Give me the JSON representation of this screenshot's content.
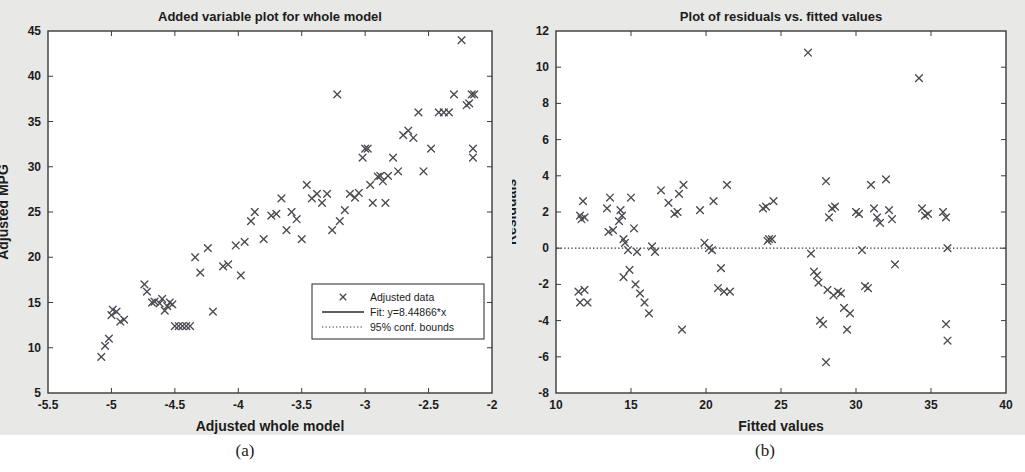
{
  "figure": {
    "background": "#e8e8e6",
    "plot_background": "#ffffff",
    "axis_color": "#3a3a3a",
    "marker_color": "#4a4a52",
    "captions": {
      "a": "(a)",
      "b": "(b)"
    }
  },
  "chart_data": [
    {
      "type": "scatter",
      "panel": "a",
      "title": "Added variable plot for whole model",
      "xlabel": "Adjusted whole model",
      "ylabel": "Adjusted MPG",
      "xlim": [
        -5.5,
        -2
      ],
      "ylim": [
        5,
        45
      ],
      "xticks": [
        -5.5,
        -5,
        -4.5,
        -4,
        -3.5,
        -3,
        -2.5,
        -2
      ],
      "xticklabels": [
        "-5.5",
        "-5",
        "-4.5",
        "-4",
        "-3.5",
        "-3",
        "-2.5",
        "-2"
      ],
      "yticks": [
        5,
        10,
        15,
        20,
        25,
        30,
        35,
        40,
        45
      ],
      "yticklabels": [
        "5",
        "10",
        "15",
        "20",
        "25",
        "30",
        "35",
        "40",
        "45"
      ],
      "grid": false,
      "marker": "x",
      "legend_position": "lower right",
      "legend": [
        {
          "label": "Adjusted data",
          "style": "marker"
        },
        {
          "label": "Fit: y=8.44866*x",
          "style": "solid-line"
        },
        {
          "label": "95% conf. bounds",
          "style": "dotted-line"
        }
      ],
      "fit": {
        "slope": 8.44866,
        "intercept": 0,
        "equation": "y=8.44866*x"
      },
      "conf_band_halfwidth": 1.0,
      "points": [
        [
          -5.08,
          9.0
        ],
        [
          -5.05,
          10.2
        ],
        [
          -5.02,
          11.0
        ],
        [
          -5.0,
          13.6
        ],
        [
          -4.99,
          14.2
        ],
        [
          -4.96,
          14.0
        ],
        [
          -4.93,
          12.9
        ],
        [
          -4.9,
          13.1
        ],
        [
          -4.74,
          17.0
        ],
        [
          -4.72,
          16.2
        ],
        [
          -4.68,
          15.0
        ],
        [
          -4.66,
          15.1
        ],
        [
          -4.62,
          14.9
        ],
        [
          -4.6,
          15.4
        ],
        [
          -4.58,
          14.1
        ],
        [
          -4.56,
          14.6
        ],
        [
          -4.54,
          15.0
        ],
        [
          -4.52,
          14.8
        ],
        [
          -4.5,
          12.4
        ],
        [
          -4.47,
          12.4
        ],
        [
          -4.44,
          12.4
        ],
        [
          -4.41,
          12.4
        ],
        [
          -4.38,
          12.4
        ],
        [
          -4.34,
          20.0
        ],
        [
          -4.3,
          18.3
        ],
        [
          -4.24,
          21.0
        ],
        [
          -4.2,
          14.0
        ],
        [
          -4.12,
          19.0
        ],
        [
          -4.08,
          19.2
        ],
        [
          -4.02,
          21.3
        ],
        [
          -3.98,
          18.0
        ],
        [
          -3.95,
          21.7
        ],
        [
          -3.9,
          24.0
        ],
        [
          -3.87,
          25.0
        ],
        [
          -3.8,
          22.0
        ],
        [
          -3.74,
          24.6
        ],
        [
          -3.7,
          24.8
        ],
        [
          -3.66,
          26.5
        ],
        [
          -3.62,
          23.0
        ],
        [
          -3.58,
          25.0
        ],
        [
          -3.54,
          24.2
        ],
        [
          -3.5,
          22.0
        ],
        [
          -3.46,
          28.0
        ],
        [
          -3.42,
          26.5
        ],
        [
          -3.38,
          27.0
        ],
        [
          -3.34,
          26.0
        ],
        [
          -3.3,
          27.0
        ],
        [
          -3.26,
          23.0
        ],
        [
          -3.22,
          38.0
        ],
        [
          -3.2,
          24.0
        ],
        [
          -3.16,
          25.2
        ],
        [
          -3.12,
          27.0
        ],
        [
          -3.08,
          26.6
        ],
        [
          -3.05,
          27.1
        ],
        [
          -3.02,
          31.0
        ],
        [
          -3.0,
          32.0
        ],
        [
          -2.98,
          32.0
        ],
        [
          -2.96,
          28.0
        ],
        [
          -2.94,
          26.0
        ],
        [
          -2.9,
          28.9
        ],
        [
          -2.88,
          29.0
        ],
        [
          -2.86,
          28.4
        ],
        [
          -2.84,
          26.0
        ],
        [
          -2.82,
          29.0
        ],
        [
          -2.78,
          31.0
        ],
        [
          -2.74,
          29.5
        ],
        [
          -2.7,
          33.5
        ],
        [
          -2.66,
          34.0
        ],
        [
          -2.62,
          33.2
        ],
        [
          -2.58,
          36.0
        ],
        [
          -2.54,
          29.5
        ],
        [
          -2.48,
          32.0
        ],
        [
          -2.42,
          36.0
        ],
        [
          -2.38,
          36.0
        ],
        [
          -2.34,
          36.0
        ],
        [
          -2.3,
          38.0
        ],
        [
          -2.24,
          44.0
        ],
        [
          -2.2,
          36.8
        ],
        [
          -2.18,
          37.0
        ],
        [
          -2.16,
          38.0
        ],
        [
          -2.14,
          38.0
        ],
        [
          -2.15,
          32.0
        ],
        [
          -2.15,
          31.0
        ]
      ]
    },
    {
      "type": "scatter",
      "panel": "b",
      "title": "Plot of residuals vs. fitted values",
      "xlabel": "Fitted values",
      "ylabel": "Residuals",
      "xlim": [
        10,
        40
      ],
      "ylim": [
        -8,
        12
      ],
      "xticks": [
        10,
        15,
        20,
        25,
        30,
        35,
        40
      ],
      "xticklabels": [
        "10",
        "15",
        "20",
        "25",
        "30",
        "35",
        "40"
      ],
      "yticks": [
        -8,
        -6,
        -4,
        -2,
        0,
        2,
        4,
        6,
        8,
        10,
        12
      ],
      "yticklabels": [
        "-8",
        "-6",
        "-4",
        "-2",
        "0",
        "2",
        "4",
        "6",
        "8",
        "10",
        "12"
      ],
      "grid": false,
      "marker": "x",
      "zero_line": 0,
      "zero_line_style": "dotted",
      "points": [
        [
          11.8,
          2.6
        ],
        [
          11.6,
          1.8
        ],
        [
          11.7,
          1.6
        ],
        [
          11.9,
          1.7
        ],
        [
          11.5,
          -2.4
        ],
        [
          11.9,
          -2.3
        ],
        [
          11.6,
          -3.0
        ],
        [
          12.1,
          -3.0
        ],
        [
          13.6,
          2.8
        ],
        [
          13.4,
          2.2
        ],
        [
          13.5,
          0.9
        ],
        [
          13.8,
          1.0
        ],
        [
          14.3,
          2.1
        ],
        [
          14.4,
          1.8
        ],
        [
          14.2,
          1.5
        ],
        [
          14.5,
          0.5
        ],
        [
          14.6,
          0.3
        ],
        [
          14.8,
          -0.1
        ],
        [
          14.9,
          -1.2
        ],
        [
          14.5,
          -1.6
        ],
        [
          15.0,
          2.8
        ],
        [
          15.2,
          1.1
        ],
        [
          15.4,
          -0.2
        ],
        [
          15.3,
          -2.0
        ],
        [
          15.6,
          -2.5
        ],
        [
          15.9,
          -3.0
        ],
        [
          16.2,
          -3.6
        ],
        [
          16.4,
          0.1
        ],
        [
          16.6,
          -0.2
        ],
        [
          17.0,
          3.2
        ],
        [
          17.5,
          2.5
        ],
        [
          17.9,
          1.9
        ],
        [
          18.1,
          2.0
        ],
        [
          18.2,
          3.0
        ],
        [
          18.5,
          3.5
        ],
        [
          18.4,
          -4.5
        ],
        [
          19.6,
          2.1
        ],
        [
          19.9,
          0.3
        ],
        [
          20.2,
          0.0
        ],
        [
          20.4,
          -0.1
        ],
        [
          20.5,
          2.6
        ],
        [
          20.8,
          -2.2
        ],
        [
          21.0,
          -1.1
        ],
        [
          21.2,
          -2.4
        ],
        [
          21.6,
          -2.4
        ],
        [
          21.4,
          3.5
        ],
        [
          23.8,
          2.2
        ],
        [
          24.0,
          2.3
        ],
        [
          24.2,
          0.5
        ],
        [
          24.1,
          0.4
        ],
        [
          24.4,
          0.5
        ],
        [
          24.5,
          2.6
        ],
        [
          26.8,
          10.8
        ],
        [
          27.0,
          -0.3
        ],
        [
          27.2,
          -1.3
        ],
        [
          27.4,
          -1.5
        ],
        [
          27.5,
          -1.9
        ],
        [
          27.6,
          -4.0
        ],
        [
          27.8,
          -4.2
        ],
        [
          28.0,
          3.7
        ],
        [
          28.2,
          1.7
        ],
        [
          28.4,
          2.2
        ],
        [
          28.6,
          2.3
        ],
        [
          28.1,
          -2.3
        ],
        [
          28.5,
          -2.6
        ],
        [
          28.8,
          -2.4
        ],
        [
          29.0,
          -2.5
        ],
        [
          29.2,
          -3.3
        ],
        [
          29.4,
          -4.5
        ],
        [
          29.6,
          -3.6
        ],
        [
          28.0,
          -6.3
        ],
        [
          30.0,
          2.0
        ],
        [
          30.2,
          1.9
        ],
        [
          30.4,
          -0.1
        ],
        [
          30.6,
          -2.1
        ],
        [
          30.8,
          -2.2
        ],
        [
          31.0,
          3.5
        ],
        [
          31.2,
          2.2
        ],
        [
          31.4,
          1.7
        ],
        [
          31.6,
          1.4
        ],
        [
          32.0,
          3.8
        ],
        [
          32.2,
          2.1
        ],
        [
          32.4,
          1.6
        ],
        [
          32.6,
          -0.9
        ],
        [
          34.2,
          9.4
        ],
        [
          34.4,
          2.2
        ],
        [
          34.6,
          1.8
        ],
        [
          34.8,
          1.9
        ],
        [
          35.8,
          2.0
        ],
        [
          36.0,
          1.7
        ],
        [
          36.1,
          0.0
        ],
        [
          36.0,
          -4.2
        ],
        [
          36.1,
          -5.1
        ]
      ]
    }
  ]
}
